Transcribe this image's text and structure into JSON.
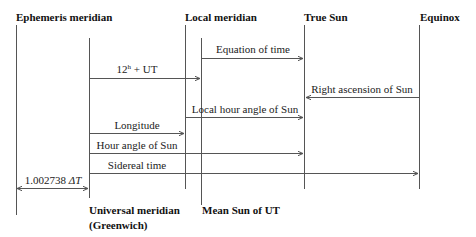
{
  "headers": {
    "ephemeris": "Ephemeris meridian",
    "local": "Local meridian",
    "true_sun": "True Sun",
    "equinox": "Equinox",
    "universal_line1": "Universal meridian",
    "universal_line2": "(Greenwich)",
    "mean_sun": "Mean Sun of UT"
  },
  "arrows": {
    "equation_of_time": "Equation of time",
    "twelve_h_ut_base": "12",
    "twelve_h_ut_sup": "h",
    "twelve_h_ut_rest": " + UT",
    "right_ascension": "Right ascension of Sun",
    "local_hour_angle": "Local hour angle of Sun",
    "longitude": "Longitude",
    "hour_angle": "Hour angle of Sun",
    "sidereal_time": "Sidereal time",
    "delta_t_coef": "1.002738 ",
    "delta_t_sym": "ΔT"
  },
  "colors": {
    "line": "#555555",
    "text": "#222222"
  }
}
